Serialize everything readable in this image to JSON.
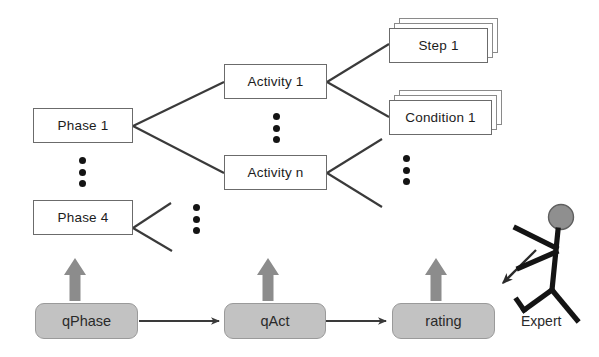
{
  "diagram": {
    "colors": {
      "box_border": "#6b6b6b",
      "box_fill": "#ffffff",
      "gray_node_fill": "#c2c2c2",
      "gray_arrow": "#8c8c8c",
      "line": "#3a3a3a",
      "text": "#1c1c1c",
      "stick_head_fill": "#8f8f8f"
    },
    "hierarchy": {
      "phases": [
        {
          "id": "phase-1",
          "label": "Phase 1"
        },
        {
          "id": "phase-4",
          "label": "Phase 4"
        }
      ],
      "activities": [
        {
          "id": "activity-1",
          "label": "Activity 1"
        },
        {
          "id": "activity-n",
          "label": "Activity n"
        }
      ],
      "leaves": [
        {
          "id": "step-1",
          "label": "Step 1",
          "stacked": true
        },
        {
          "id": "condition-1",
          "label": "Condition 1",
          "stacked": true
        }
      ]
    },
    "questionnaires": [
      {
        "id": "qphase",
        "label": "qPhase"
      },
      {
        "id": "qact",
        "label": "qAct"
      },
      {
        "id": "rating",
        "label": "rating"
      }
    ],
    "actor": {
      "id": "expert",
      "label": "Expert",
      "icon": "stick-figure-icon"
    },
    "ellipses": [
      {
        "id": "phase-ellipsis",
        "dots": 3
      },
      {
        "id": "activity-ellipsis",
        "dots": 3
      },
      {
        "id": "leaf-ellipsis",
        "dots": 3
      },
      {
        "id": "phase4-children-ellipsis",
        "dots": 3
      }
    ],
    "arrows": {
      "up_arrows": 3,
      "flow_arrows": 2,
      "expert_arrow": 1
    }
  }
}
